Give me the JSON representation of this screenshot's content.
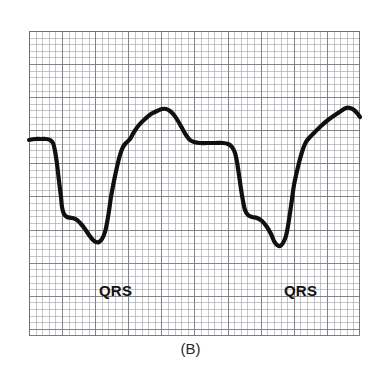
{
  "figure": {
    "caption": "(B)",
    "annotations": [
      {
        "text": "QRS",
        "x": 70,
        "y": 252
      },
      {
        "text": "QRS",
        "x": 255,
        "y": 252
      }
    ],
    "colors": {
      "trace": "#101010",
      "grid_major": "#78788a",
      "grid_minor": "#9696a0",
      "background": "#ffffff",
      "text": "#121212"
    }
  },
  "chart_data": {
    "type": "line",
    "title": "(B)",
    "subtitle": "",
    "xlabel": "",
    "ylabel": "",
    "grid": true,
    "grid_minor_px": 6.62,
    "grid_major_px": 33.1,
    "legend": null,
    "axis_ranges": {
      "x_px": [
        29,
        360
      ],
      "y_px": [
        31,
        336
      ]
    },
    "annotations": [
      "QRS",
      "QRS"
    ],
    "series": [
      {
        "name": "ECG waveform",
        "color": "#101010",
        "line_width_px": 4.2,
        "points": [
          [
            0,
            109
          ],
          [
            6,
            108
          ],
          [
            12,
            108
          ],
          [
            17,
            108
          ],
          [
            21,
            109
          ],
          [
            24,
            112
          ],
          [
            26,
            120
          ],
          [
            28,
            133
          ],
          [
            30,
            150
          ],
          [
            32,
            166
          ],
          [
            33,
            176
          ],
          [
            35,
            183
          ],
          [
            38,
            186
          ],
          [
            43,
            187
          ],
          [
            48,
            189
          ],
          [
            52,
            193
          ],
          [
            56,
            198
          ],
          [
            60,
            204
          ],
          [
            64,
            209
          ],
          [
            67,
            211
          ],
          [
            70,
            211
          ],
          [
            73,
            208
          ],
          [
            76,
            201
          ],
          [
            78,
            192
          ],
          [
            80,
            180
          ],
          [
            82,
            166
          ],
          [
            85,
            150
          ],
          [
            88,
            136
          ],
          [
            91,
            124
          ],
          [
            94,
            116
          ],
          [
            97,
            112
          ],
          [
            101,
            108
          ],
          [
            105,
            101
          ],
          [
            110,
            94
          ],
          [
            116,
            88
          ],
          [
            122,
            83
          ],
          [
            128,
            80
          ],
          [
            133,
            78
          ],
          [
            137,
            78
          ],
          [
            141,
            80
          ],
          [
            145,
            84
          ],
          [
            149,
            90
          ],
          [
            153,
            97
          ],
          [
            157,
            104
          ],
          [
            161,
            109
          ],
          [
            165,
            111
          ],
          [
            171,
            112
          ],
          [
            178,
            112
          ],
          [
            186,
            112
          ],
          [
            194,
            112
          ],
          [
            199,
            113
          ],
          [
            203,
            116
          ],
          [
            206,
            122
          ],
          [
            208,
            131
          ],
          [
            210,
            144
          ],
          [
            212,
            158
          ],
          [
            214,
            170
          ],
          [
            216,
            179
          ],
          [
            219,
            184
          ],
          [
            223,
            186
          ],
          [
            228,
            187
          ],
          [
            233,
            190
          ],
          [
            238,
            196
          ],
          [
            242,
            203
          ],
          [
            245,
            210
          ],
          [
            248,
            214
          ],
          [
            251,
            215
          ],
          [
            254,
            212
          ],
          [
            257,
            205
          ],
          [
            259,
            195
          ],
          [
            261,
            182
          ],
          [
            263,
            168
          ],
          [
            265,
            154
          ],
          [
            268,
            140
          ],
          [
            271,
            128
          ],
          [
            274,
            118
          ],
          [
            277,
            111
          ],
          [
            281,
            106
          ],
          [
            286,
            101
          ],
          [
            292,
            95
          ],
          [
            299,
            89
          ],
          [
            306,
            84
          ],
          [
            312,
            80
          ],
          [
            317,
            77
          ],
          [
            321,
            77
          ],
          [
            325,
            79
          ],
          [
            328,
            82
          ],
          [
            331,
            86
          ]
        ]
      }
    ]
  }
}
